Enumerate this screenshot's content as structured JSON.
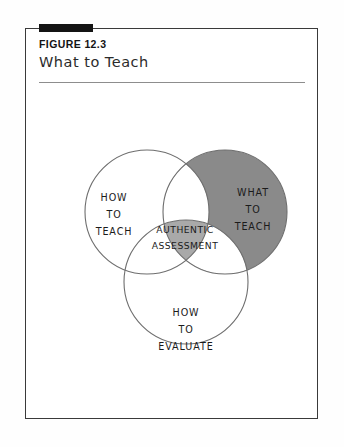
{
  "figure": {
    "label": "FIGURE 12.3",
    "title": "What to Teach"
  },
  "colors": {
    "frame_border": "#3a3a3a",
    "tab_bar": "#141414",
    "rule": "#8d8d8d",
    "circle_stroke": "#6e6e6e",
    "what_to_teach_fill": "#8a8a8a",
    "authentic_assessment_fill": "#a9a9a9",
    "page_background": "#ffffff",
    "text": "#1b1b1b"
  },
  "chart_data": {
    "type": "venn",
    "title": "What to Teach",
    "sets": [
      {
        "id": "how-to-teach",
        "label_lines": [
          "HOW",
          "TO",
          "TEACH"
        ],
        "cx": 122,
        "cy": 82,
        "r": 62,
        "fill": "none",
        "shaded": false
      },
      {
        "id": "what-to-teach",
        "label_lines": [
          "WHAT",
          "TO",
          "TEACH"
        ],
        "cx": 200,
        "cy": 82,
        "r": 62,
        "fill": "#8a8a8a",
        "shaded": true
      },
      {
        "id": "how-to-evaluate",
        "label_lines": [
          "HOW",
          "TO",
          "EVALUATE"
        ],
        "cx": 161,
        "cy": 152,
        "r": 62,
        "fill": "none",
        "shaded": false
      }
    ],
    "intersections": [
      {
        "id": "triple-intersection",
        "of": [
          "how-to-teach",
          "what-to-teach",
          "how-to-evaluate"
        ],
        "label_lines": [
          "AUTHENTIC",
          "ASSESSMENT"
        ],
        "fill": "#a9a9a9"
      }
    ],
    "legend": "none",
    "grid": false
  }
}
